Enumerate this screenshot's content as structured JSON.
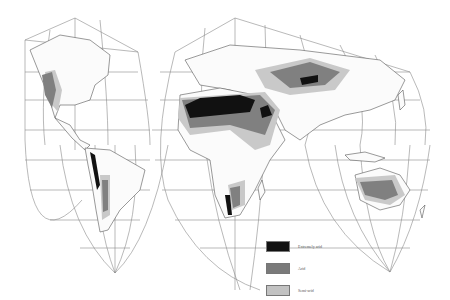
{
  "map": {
    "projection": "interrupted homolosine",
    "theme": "world arid regions",
    "legend": {
      "items": [
        {
          "label": "Extremely arid",
          "color": "#111111"
        },
        {
          "label": "Arid",
          "color": "#7a7a7a"
        },
        {
          "label": "Semi-arid",
          "color": "#c2c2c2"
        }
      ]
    },
    "regions": [
      {
        "name": "North American southwest",
        "category": "arid"
      },
      {
        "name": "Atacama / Andes west coast",
        "category": "extremely arid"
      },
      {
        "name": "Patagonia",
        "category": "arid"
      },
      {
        "name": "Sahara",
        "category": "extremely arid"
      },
      {
        "name": "Sahel",
        "category": "arid"
      },
      {
        "name": "Arabian Peninsula (Rub' al Khali)",
        "category": "extremely arid"
      },
      {
        "name": "Horn of Africa",
        "category": "arid"
      },
      {
        "name": "Namib / Kalahari",
        "category": "extremely arid"
      },
      {
        "name": "Central Asia",
        "category": "arid"
      },
      {
        "name": "Taklamakan",
        "category": "extremely arid"
      },
      {
        "name": "Australian interior",
        "category": "arid"
      }
    ]
  }
}
